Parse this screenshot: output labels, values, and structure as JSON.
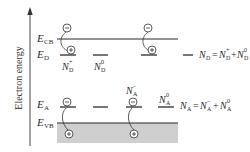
{
  "diagram": {
    "axis": {
      "label": "Electron energy",
      "direction": "up"
    },
    "levels": {
      "conduction_band": {
        "symbol": "E",
        "subscript": "CB"
      },
      "donor": {
        "symbol": "E",
        "subscript": "D"
      },
      "acceptor": {
        "symbol": "E",
        "subscript": "A"
      },
      "valence_band": {
        "symbol": "E",
        "subscript": "VB"
      }
    },
    "donor_states": {
      "ionized": {
        "symbol": "N",
        "sub": "D",
        "sup": "+"
      },
      "neutral": {
        "symbol": "N",
        "sub": "D",
        "sup": "0"
      },
      "equation": {
        "lhs_symbol": "N",
        "lhs_sub": "D",
        "eq": "=",
        "t1_symbol": "N",
        "t1_sub": "D",
        "t1_sup": "+",
        "plus": "+",
        "t2_symbol": "N",
        "t2_sub": "D",
        "t2_sup": "0"
      }
    },
    "acceptor_states": {
      "ionized": {
        "symbol": "N",
        "sub": "A",
        "sup": "−"
      },
      "neutral": {
        "symbol": "N",
        "sub": "A",
        "sup": "0"
      },
      "equation": {
        "lhs_symbol": "N",
        "lhs_sub": "A",
        "eq": "=",
        "t1_symbol": "N",
        "t1_sub": "A",
        "t1_sup": "−",
        "plus": "+",
        "t2_symbol": "N",
        "t2_sub": "A",
        "t2_sup": "0"
      }
    },
    "charges": {
      "electron": "−",
      "hole": "+"
    },
    "colors": {
      "line": "#2a2a2a",
      "band_fill": "#cfcfcf"
    }
  }
}
